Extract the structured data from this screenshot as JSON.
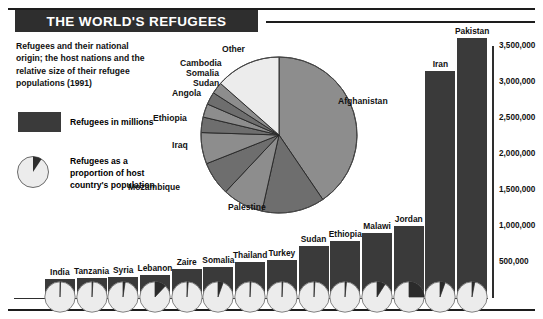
{
  "header": {
    "title": "THE WORLD'S REFUGEES",
    "subtitle": "Refugees and their national origin; the host nations and the relative size of their refugee populations (1991)"
  },
  "legend": {
    "items": [
      {
        "icon": "dark-rectangle-swatch",
        "label": "Refugees in millions"
      },
      {
        "icon": "proportion-pie-icon",
        "label": "Refugees as a proportion of host country's population"
      }
    ]
  },
  "chart_data": [
    {
      "type": "pie",
      "title": "Refugees by national origin",
      "legend_position": "callout-labels",
      "categories": [
        "Afghanistan",
        "Palestine",
        "Mozambique",
        "Iraq",
        "Ethiopia",
        "Angola",
        "Sudan",
        "Somalia",
        "Cambodia",
        "Other"
      ],
      "values": [
        40.5,
        13.0,
        8.5,
        7.0,
        6.5,
        3.2,
        2.8,
        2.6,
        2.4,
        13.5
      ],
      "unit": "percent of world refugee total"
    },
    {
      "type": "bar",
      "title": "Refugees in millions by host nation",
      "xlabel": "",
      "ylabel": "",
      "ylim": [
        0,
        3750000
      ],
      "yticks": [
        500000,
        1000000,
        1500000,
        2000000,
        2500000,
        3000000,
        3500000
      ],
      "ytick_labels": [
        "500,000",
        "1,000,000",
        "1,500,000",
        "2,000,000",
        "2,500,000",
        "3,000,000",
        "3,500,000"
      ],
      "grid": false,
      "categories": [
        "India",
        "Tanzania",
        "Syria",
        "Lebanon",
        "Zaire",
        "Somalia",
        "Thailand",
        "Turkey",
        "Sudan",
        "Ethiopia",
        "Malawi",
        "Jordan",
        "Iran",
        "Pakistan"
      ],
      "values": [
        260000,
        270000,
        290000,
        310000,
        390000,
        420000,
        500000,
        520000,
        720000,
        780000,
        900000,
        1000000,
        3150000,
        3600000
      ],
      "series": [
        {
          "name": "Refugees as a proportion of host country's population",
          "unit": "percent",
          "values": [
            0.4,
            1.0,
            2.3,
            12.0,
            1.3,
            5.5,
            1.0,
            0.9,
            1.0,
            1.6,
            9.0,
            25.0,
            5.5,
            3.0
          ]
        }
      ]
    }
  ]
}
